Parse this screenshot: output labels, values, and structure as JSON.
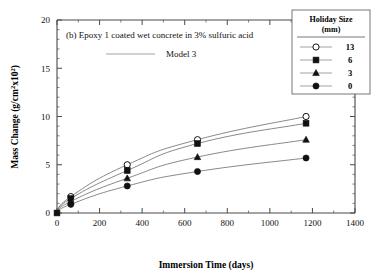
{
  "chart_data": {
    "type": "line",
    "title": "(b)   Epoxy 1 coated wet concrete in 3% sulfuric acid",
    "panel_label": "(b)",
    "model_label": "Model 3",
    "xlabel": "Immersion Time (days)",
    "ylabel_full": "Mass Change (g/cm²x10²)",
    "ylabel_main": "Mass Change (g/cm",
    "ylabel_sup1": "2",
    "ylabel_mid": "x10",
    "ylabel_sup2": "2",
    "ylabel_close": ")",
    "xlim": [
      0,
      1400
    ],
    "ylim": [
      0,
      20
    ],
    "xticks": [
      0,
      200,
      400,
      600,
      800,
      1000,
      1200,
      1400
    ],
    "yticks": [
      0,
      5,
      10,
      15,
      20
    ],
    "xtick_labels": [
      "0",
      "200",
      "400",
      "600",
      "800",
      "1000",
      "1200",
      "1400"
    ],
    "ytick_labels": [
      "0",
      "5",
      "10",
      "15",
      "20"
    ],
    "x_minor_step": 100,
    "y_minor_step": 1,
    "grid": false,
    "legend_position": "top-right",
    "legend_title_line1": "Holiday Size",
    "legend_title_line2": "(mm)",
    "series": [
      {
        "name": "13",
        "marker": "open-circle",
        "x": [
          0,
          65,
          330,
          660,
          1170
        ],
        "values": [
          0,
          1.7,
          5.0,
          7.6,
          10.0
        ]
      },
      {
        "name": "6",
        "marker": "filled-square",
        "x": [
          0,
          65,
          330,
          660,
          1170
        ],
        "values": [
          0,
          1.5,
          4.4,
          7.2,
          9.3
        ]
      },
      {
        "name": "3",
        "marker": "filled-triangle",
        "x": [
          0,
          65,
          330,
          660,
          1170
        ],
        "values": [
          0,
          1.2,
          3.6,
          5.8,
          7.6
        ]
      },
      {
        "name": "0",
        "marker": "filled-circle",
        "x": [
          0,
          65,
          330,
          660,
          1170
        ],
        "values": [
          0,
          0.9,
          2.8,
          4.3,
          5.7
        ]
      }
    ]
  },
  "colors": {
    "curve": "#6b6b6b",
    "marker_fill": "#111111",
    "marker_open": "#ffffff",
    "axis": "#4a4a4a",
    "background": "#ffffff"
  }
}
